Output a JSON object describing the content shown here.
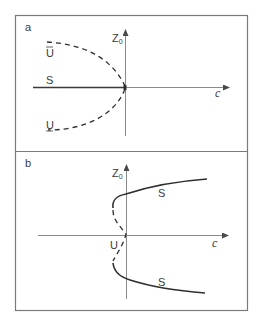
{
  "figure": {
    "panels": [
      {
        "id": "a",
        "label": "a",
        "y_axis_label": "Z",
        "y_axis_subscript": "0",
        "x_axis_label": "c",
        "branches": [
          {
            "name": "upper-unstable",
            "label": "U",
            "style": "dashed"
          },
          {
            "name": "stable",
            "label": "S",
            "style": "solid"
          },
          {
            "name": "lower-unstable",
            "label": "U",
            "style": "dashed"
          }
        ]
      },
      {
        "id": "b",
        "label": "b",
        "y_axis_label": "Z",
        "y_axis_subscript": "0",
        "x_axis_label": "c",
        "branches": [
          {
            "name": "upper-stable",
            "label": "S",
            "style": "solid"
          },
          {
            "name": "middle-unstable",
            "label": "U",
            "style": "dashed"
          },
          {
            "name": "lower-stable",
            "label": "S",
            "style": "solid"
          }
        ]
      }
    ],
    "colors": {
      "frame": "#7a7a7a",
      "axis": "#8a8a8a",
      "curve": "#2e2e2e",
      "text": "#3a3a3a"
    }
  }
}
